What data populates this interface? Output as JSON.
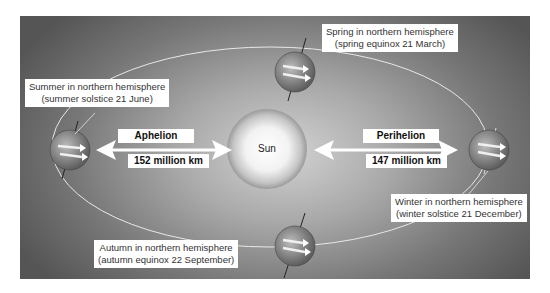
{
  "diagram": {
    "sun": {
      "label": "Sun"
    },
    "aphelion": {
      "label": "Aphelion",
      "distance": "152 million km"
    },
    "perihelion": {
      "label": "Perihelion",
      "distance": "147 million km"
    },
    "seasons": [
      {
        "id": "summer",
        "line1": "Summer in northern hemisphere",
        "line2": "(summer solstice 21 June)"
      },
      {
        "id": "spring",
        "line1": "Spring in northern hemisphere",
        "line2": "(spring equinox 21 March)"
      },
      {
        "id": "winter",
        "line1": "Winter in northern hemisphere",
        "line2": "(winter solstice 21 December)"
      },
      {
        "id": "autumn",
        "line1": "Autumn in northern hemisphere",
        "line2": "(autumn equinox 22 September)"
      }
    ],
    "colors": {
      "background_dark": "#555555",
      "background_light": "#d2d2d2",
      "orbit_line": "#e8e8e8",
      "label_bg": "#ffffff",
      "text": "#333333"
    }
  }
}
